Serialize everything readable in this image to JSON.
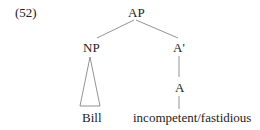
{
  "example_number": "(52)",
  "tree": {
    "root": "AP",
    "left_child": "NP",
    "right_child": "A'",
    "head": "A",
    "left_terminal": "Bill",
    "right_terminal": "incompetent/fastidious"
  },
  "colors": {
    "line": "#777777",
    "text": "#222222"
  }
}
